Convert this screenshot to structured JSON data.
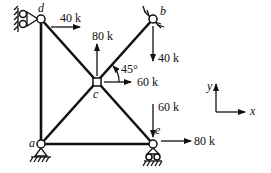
{
  "diagram": {
    "type": "truss",
    "nodes": [
      {
        "id": "a",
        "label": "a",
        "support": "pin"
      },
      {
        "id": "b",
        "label": "b",
        "support": "pin-inclined"
      },
      {
        "id": "c",
        "label": "c",
        "support": "none"
      },
      {
        "id": "d",
        "label": "d",
        "support": "roller-vertical-wall"
      },
      {
        "id": "e",
        "label": "e",
        "support": "roller"
      }
    ],
    "members": [
      [
        "a",
        "d"
      ],
      [
        "a",
        "e"
      ],
      [
        "a",
        "c"
      ],
      [
        "c",
        "b"
      ],
      [
        "d",
        "c"
      ],
      [
        "c",
        "e"
      ]
    ],
    "loads": [
      {
        "node": "d",
        "direction": "right",
        "label": "40 k"
      },
      {
        "node": "c",
        "direction": "up",
        "label": "80 k"
      },
      {
        "node": "c",
        "direction": "right",
        "label": "60 k"
      },
      {
        "node": "b",
        "direction": "down",
        "label": "40 k"
      },
      {
        "node": "e",
        "direction": "down",
        "label": "60 k"
      },
      {
        "node": "e",
        "direction": "right",
        "label": "80 k"
      }
    ],
    "angle_label": "45°",
    "axes": {
      "x": "x",
      "y": "y"
    }
  }
}
